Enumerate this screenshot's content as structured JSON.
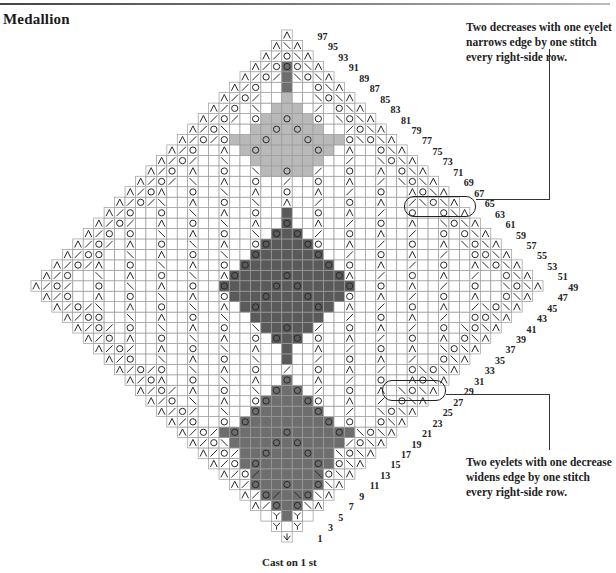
{
  "title": "Medallion",
  "caption": "Cast on 1 st",
  "annotations": {
    "top_note": "Two decreases with one eyelet narrows edge by one stitch every right-side row.",
    "bottom_note": "Two eyelets with one decrease widens edge by one stitch every right-side row."
  },
  "row_numbers": [
    1,
    3,
    5,
    7,
    9,
    11,
    13,
    15,
    17,
    19,
    21,
    23,
    25,
    27,
    29,
    31,
    33,
    35,
    37,
    39,
    41,
    43,
    45,
    47,
    49,
    51,
    53,
    55,
    57,
    59,
    61,
    63,
    65,
    67,
    69,
    71,
    73,
    75,
    77,
    79,
    81,
    83,
    85,
    87,
    89,
    91,
    93,
    95,
    97
  ],
  "grid": {
    "cell_px": 10.45,
    "center_x": 287,
    "bottom_y": 542,
    "max_half_width": 24,
    "widest_row_index": 24,
    "grid_color": "#9a9a9a",
    "symbol_color": "#2a2a2a",
    "light_shade": "#b9b9b9",
    "dark_shade": "#6e6e6e",
    "darker_shade": "#5a5a5a"
  },
  "legend_symbols": {
    "O": "yarn-over (eyelet)",
    "/": "k2tog",
    "\\": "ssk",
    "A": "sk2p double decrease",
    "Y": "increase",
    "V": "cast-on stitch"
  }
}
